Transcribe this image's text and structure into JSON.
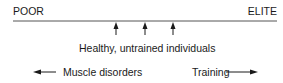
{
  "scale": {
    "left_label": "POOR",
    "right_label": "ELITE"
  },
  "markers": {
    "count": 3,
    "label": "Healthy, untrained individuals"
  },
  "directions": {
    "left_label": "Muscle disorders",
    "right_label": "Training"
  },
  "colors": {
    "ink": "#1a1a1a",
    "line": "#555555",
    "background": "#ffffff"
  }
}
